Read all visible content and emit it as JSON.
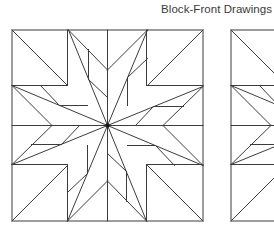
{
  "header": {
    "title": "Block-Front Drawings"
  },
  "style": {
    "line_color": "#3c3c3c",
    "title_color": "#3a3a3a",
    "center_dot_color": "#1a1a1a"
  },
  "blocks": [
    {
      "name": "block-front-drawing-1",
      "x": 12,
      "y": 30,
      "size": 191
    },
    {
      "name": "block-front-drawing-2",
      "x": 231,
      "y": 30,
      "size": 191
    }
  ],
  "pattern": {
    "description": "16-point pinwheel star quilt block, 4-fold rotational symmetry; coordinates relative to block center, in block-size units of 191",
    "half": 95.5,
    "grid_offsets": [
      -55.5,
      0,
      39.5
    ],
    "sector_segments_left_arm": [
      [
        -95.5,
        -40,
        -55.5,
        0
      ],
      [
        -55.5,
        0,
        -95.5,
        39
      ],
      [
        -95.5,
        -40,
        0,
        0
      ],
      [
        -95.5,
        39,
        0,
        0
      ],
      [
        -95.5,
        0,
        0,
        0
      ],
      [
        -67,
        -40,
        -48,
        -20
      ],
      [
        -48,
        -20,
        -20,
        -20
      ],
      [
        -76,
        19,
        -46,
        19
      ],
      [
        -46,
        19,
        -28,
        0
      ]
    ],
    "corner_segments_top_left": [
      [
        -95.5,
        -95.5,
        -40,
        -40
      ]
    ],
    "grid_segments": [
      [
        -40,
        -95.5,
        -40,
        -40
      ],
      [
        -95.5,
        -40,
        -40,
        -40
      ],
      [
        39,
        -95.5,
        39,
        -40
      ],
      [
        39,
        -40,
        95.5,
        -40
      ],
      [
        -95.5,
        39,
        -40,
        39
      ],
      [
        -40,
        39,
        -40,
        95.5
      ],
      [
        39,
        39,
        95.5,
        39
      ],
      [
        39,
        39,
        39,
        95.5
      ]
    ]
  }
}
